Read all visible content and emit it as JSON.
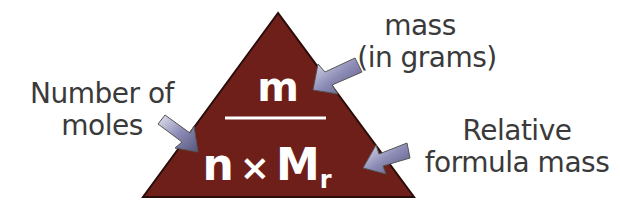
{
  "triangle": {
    "numerator": "m",
    "denominator_n": "n",
    "times": "×",
    "denominator_M": "M",
    "subscript": "r",
    "fill_color": "#6e1f1a",
    "arrow_color": "#7a7aa6"
  },
  "labels": {
    "mass_line1": "mass",
    "mass_line2": "(in grams)",
    "moles_line1": "Number of",
    "moles_line2": "moles",
    "rfm_line1": "Relative",
    "rfm_line2": "formula mass"
  }
}
